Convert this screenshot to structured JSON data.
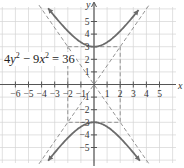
{
  "chart_data": {
    "type": "line",
    "title": "",
    "equation": "4y^2 - 9x^2 = 36",
    "equation_parts": {
      "a": "4",
      "v1": "y",
      "mid": " − 9",
      "v2": "x",
      "rhs": " = 36",
      "exp": "2"
    },
    "xlabel": "x",
    "ylabel": "y",
    "xlim": [
      -7,
      6.2
    ],
    "ylim": [
      -6.2,
      6.5
    ],
    "x_ticks": [
      -6,
      -5,
      -4,
      -3,
      -2,
      -1,
      1,
      2,
      3,
      4,
      5
    ],
    "y_ticks": [
      -5,
      -4,
      -3,
      -2,
      -1,
      1,
      2,
      3,
      4,
      5
    ],
    "grid": true,
    "series": [
      {
        "name": "upper branch",
        "style": "solid",
        "arrows": "both",
        "formula": "y = sqrt(9 + 9x^2/4)",
        "x_range": [
          -3.5,
          3.4
        ],
        "points": [
          [
            -3.5,
            6.05
          ],
          [
            -3,
            5.41
          ],
          [
            -2,
            4.24
          ],
          [
            -1,
            3.35
          ],
          [
            0,
            3
          ],
          [
            1,
            3.35
          ],
          [
            2,
            4.24
          ],
          [
            3,
            5.41
          ],
          [
            3.4,
            5.91
          ]
        ]
      },
      {
        "name": "lower branch",
        "style": "solid",
        "arrows": "both",
        "formula": "y = -sqrt(9 + 9x^2/4)",
        "x_range": [
          -3.5,
          3.5
        ],
        "points": [
          [
            -3.5,
            -6.05
          ],
          [
            -3,
            -5.41
          ],
          [
            -2,
            -4.24
          ],
          [
            -1,
            -3.35
          ],
          [
            0,
            -3
          ],
          [
            1,
            -3.35
          ],
          [
            2,
            -4.24
          ],
          [
            3,
            -5.41
          ],
          [
            3.5,
            -6.05
          ]
        ]
      },
      {
        "name": "asymptote y = 1.5x",
        "style": "dashed",
        "points": [
          [
            -4.2,
            -6.3
          ],
          [
            4.2,
            6.3
          ]
        ]
      },
      {
        "name": "asymptote y = -1.5x",
        "style": "dashed",
        "points": [
          [
            -4.2,
            6.3
          ],
          [
            4.2,
            -6.3
          ]
        ]
      },
      {
        "name": "fundamental rectangle",
        "style": "dashed",
        "points": [
          [
            -2,
            3
          ],
          [
            2,
            3
          ],
          [
            2,
            -3
          ],
          [
            -2,
            -3
          ],
          [
            -2,
            3
          ]
        ]
      }
    ],
    "vertices": [
      [
        0,
        3
      ],
      [
        0,
        -3
      ]
    ],
    "legend": "none"
  },
  "layout": {
    "origin_px": [
      94,
      84.5
    ],
    "unit_x_px": 13.1,
    "unit_y_px": 12.6,
    "grid_px": {
      "x0": 0,
      "x1": 176,
      "y0": 7,
      "y1": 163
    },
    "colors": {
      "curve": "#6b6b6b",
      "dash": "#888888",
      "grid": "#d4d4d4",
      "axis": "#555555"
    }
  }
}
